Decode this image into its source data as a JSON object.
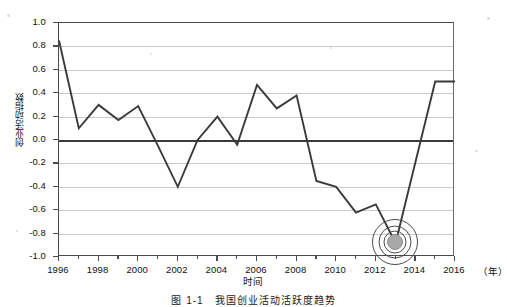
{
  "figure": {
    "caption": "图 1-1　我国创业活动活跃度趋势",
    "xlabel": "时间",
    "ylabel": "创业活动指数",
    "x_unit": "（年）"
  },
  "chart_data": {
    "type": "line",
    "title": "",
    "xlabel": "时间",
    "ylabel": "创业活动指数",
    "x_unit": "（年）",
    "xlim": [
      1996,
      2016
    ],
    "ylim": [
      -1.0,
      1.0
    ],
    "grid": true,
    "legend": "none",
    "yticks": [
      "1.0",
      "0.8",
      "0.6",
      "0.4",
      "0.2",
      "0.0",
      "-0.2",
      "-0.4",
      "-0.6",
      "-0.8",
      "-1.0"
    ],
    "ytick_values": [
      1.0,
      0.8,
      0.6,
      0.4,
      0.2,
      0.0,
      -0.2,
      -0.4,
      -0.6,
      -0.8,
      -1.0
    ],
    "xticks": [
      "1996",
      "1998",
      "2000",
      "2002",
      "2004",
      "2006",
      "2008",
      "2010",
      "2012",
      "2014",
      "2016"
    ],
    "xtick_values": [
      1996,
      1998,
      2000,
      2002,
      2004,
      2006,
      2008,
      2010,
      2012,
      2014,
      2016
    ],
    "x": [
      1996,
      1997,
      1998,
      1999,
      2000,
      2001,
      2002,
      2003,
      2004,
      2005,
      2006,
      2007,
      2008,
      2009,
      2010,
      2011,
      2012,
      2013,
      2015,
      2016
    ],
    "values": [
      0.85,
      0.1,
      0.3,
      0.17,
      0.29,
      -0.05,
      -0.4,
      0.0,
      0.2,
      -0.04,
      0.47,
      0.27,
      0.38,
      -0.35,
      -0.4,
      -0.62,
      -0.55,
      -0.88,
      0.5,
      0.5
    ],
    "series": [
      {
        "name": "创业活动指数",
        "values": [
          0.85,
          0.1,
          0.3,
          0.17,
          0.29,
          -0.05,
          -0.4,
          0.0,
          0.2,
          -0.04,
          0.47,
          0.27,
          0.38,
          -0.35,
          -0.4,
          -0.62,
          -0.55,
          -0.88,
          0.5,
          0.5
        ]
      }
    ],
    "annotations": [
      {
        "type": "target-ring-marker",
        "x": 2013,
        "y": -0.88,
        "label": ""
      }
    ],
    "color": "#3a3a3a",
    "gridcolor": "#c9c9c9"
  }
}
